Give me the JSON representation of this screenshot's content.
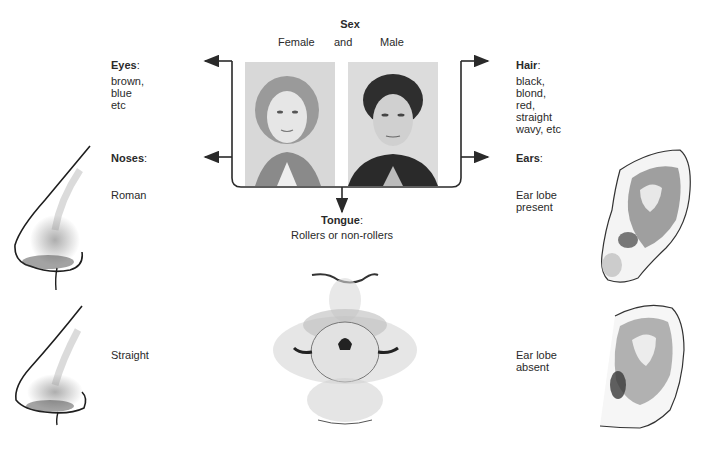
{
  "sex": {
    "heading": "Sex",
    "female_label": "Female",
    "and_label": "and",
    "male_label": "Male"
  },
  "eyes": {
    "heading": "Eyes",
    "colon": ":",
    "lines": [
      "brown,",
      "blue",
      "etc"
    ]
  },
  "hair": {
    "heading": "Hair",
    "colon": ":",
    "lines": [
      "black,",
      "blond,",
      "red,",
      "straight",
      "wavy, etc"
    ]
  },
  "noses": {
    "heading": "Noses",
    "colon": ":",
    "types": [
      "Roman",
      "Straight"
    ]
  },
  "ears": {
    "heading": "Ears",
    "colon": ":",
    "types": [
      {
        "line1": "Ear lobe",
        "line2": "present"
      },
      {
        "line1": "Ear lobe",
        "line2": "absent"
      }
    ]
  },
  "tongue": {
    "heading": "Tongue",
    "colon": ":",
    "subtitle": "Rollers or non-rollers"
  },
  "colors": {
    "line": "#2a2a2a",
    "text": "#2a2a2a",
    "photo_bg": "#dcdcdc"
  }
}
